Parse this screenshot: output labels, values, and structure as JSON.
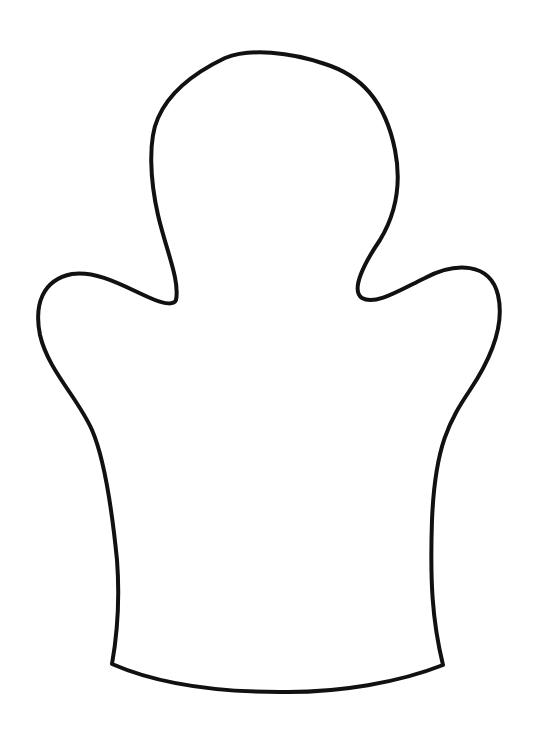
{
  "figure": {
    "subject": "hand puppet outline template",
    "colors": {
      "background": "#ffffff",
      "stroke": "#111111"
    },
    "stroke_width": 4,
    "canvas": {
      "width": 533,
      "height": 748
    },
    "parts": [
      {
        "name": "head",
        "approx_bounds": {
          "x": 150,
          "y": 52,
          "w": 245,
          "h": 250
        }
      },
      {
        "name": "left-arm",
        "approx_bounds": {
          "x": 36,
          "y": 272,
          "w": 145,
          "h": 60
        }
      },
      {
        "name": "right-arm",
        "approx_bounds": {
          "x": 355,
          "y": 265,
          "w": 147,
          "h": 65
        }
      },
      {
        "name": "body",
        "approx_bounds": {
          "x": 105,
          "y": 300,
          "w": 345,
          "h": 390
        }
      },
      {
        "name": "bottom-hem",
        "approx_bounds": {
          "x": 110,
          "y": 655,
          "w": 335,
          "h": 38
        }
      }
    ]
  }
}
